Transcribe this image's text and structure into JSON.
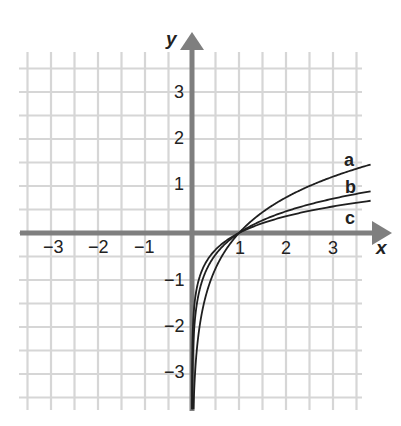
{
  "chart_data": {
    "type": "line",
    "title": "",
    "xlabel": "x",
    "ylabel": "y",
    "xlim": [
      -3.5,
      3.5
    ],
    "ylim": [
      -3.5,
      3.5
    ],
    "grid": true,
    "grid_step": 0.5,
    "x_ticks": [
      -3,
      -2,
      -1,
      1,
      2,
      3
    ],
    "y_ticks": [
      -3,
      -2,
      -1,
      1,
      2,
      3
    ],
    "x_tick_labels": [
      "−3",
      "−2",
      "−1",
      "1",
      "2",
      "3"
    ],
    "y_tick_labels": [
      "−3",
      "−2",
      "−1",
      "1",
      "2",
      "3"
    ],
    "series": [
      {
        "name": "a",
        "base": 2.5,
        "description": "logarithmic curve, steepest growth",
        "points": [
          [
            0.05,
            -3.27
          ],
          [
            0.1,
            -2.51
          ],
          [
            0.25,
            -1.51
          ],
          [
            0.5,
            -0.76
          ],
          [
            1,
            0
          ],
          [
            2,
            0.76
          ],
          [
            3,
            1.2
          ],
          [
            3.8,
            1.46
          ]
        ]
      },
      {
        "name": "b",
        "base": 4.5,
        "description": "logarithmic curve, middle growth",
        "points": [
          [
            0.01,
            -3.06
          ],
          [
            0.03,
            -2.33
          ],
          [
            0.1,
            -1.53
          ],
          [
            0.5,
            -0.46
          ],
          [
            1,
            0
          ],
          [
            2,
            0.46
          ],
          [
            3,
            0.73
          ],
          [
            3.8,
            0.89
          ]
        ]
      },
      {
        "name": "c",
        "base": 7,
        "description": "logarithmic curve, slowest growth",
        "points": [
          [
            0.002,
            -3.19
          ],
          [
            0.01,
            -2.37
          ],
          [
            0.1,
            -1.18
          ],
          [
            0.5,
            -0.36
          ],
          [
            1,
            0
          ],
          [
            2,
            0.36
          ],
          [
            3,
            0.56
          ],
          [
            3.8,
            0.69
          ]
        ]
      }
    ],
    "annotations": [
      "a",
      "b",
      "c"
    ],
    "common_point": [
      1,
      0
    ]
  },
  "labels": {
    "x_axis": "x",
    "y_axis": "y",
    "curve_a": "a",
    "curve_b": "b",
    "curve_c": "c",
    "xt": [
      "−3",
      "−2",
      "−1",
      "1",
      "2",
      "3"
    ],
    "yt": [
      "3",
      "2",
      "1",
      "−1",
      "−2",
      "−3"
    ]
  },
  "colors": {
    "grid": "#d6d6d6",
    "axis": "#7f7f7f",
    "curve": "#1f1f1f",
    "text": "#222222"
  }
}
